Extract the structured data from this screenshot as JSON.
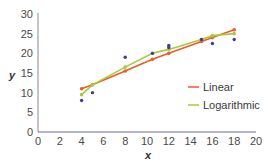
{
  "chart_data": {
    "type": "scatter",
    "title": "",
    "xlabel": "x",
    "ylabel": "y",
    "xlim": [
      0,
      20
    ],
    "ylim": [
      0,
      30
    ],
    "x_ticks": [
      "0",
      "2",
      "4",
      "6",
      "8",
      "10",
      "12",
      "14",
      "16",
      "18",
      "20"
    ],
    "y_ticks": [
      "0",
      "5",
      "10",
      "15",
      "20",
      "25",
      "30"
    ],
    "grid": false,
    "legend_position": "lower-right",
    "scatter": {
      "name": "data",
      "color": "#3b3f96",
      "points": [
        [
          4,
          8
        ],
        [
          5,
          10
        ],
        [
          8,
          19
        ],
        [
          10.5,
          20
        ],
        [
          12,
          22
        ],
        [
          12,
          21.5
        ],
        [
          15,
          23.5
        ],
        [
          16,
          22.5
        ],
        [
          18,
          23.5
        ]
      ]
    },
    "series": [
      {
        "name": "Linear",
        "color": "#ee5a2a",
        "x": [
          4,
          5,
          8,
          10.5,
          12,
          15,
          16,
          18
        ],
        "values": [
          11,
          12,
          15.5,
          18.5,
          20,
          23,
          24,
          26
        ]
      },
      {
        "name": "Logarithmic",
        "color": "#a8c93a",
        "x": [
          4,
          5,
          8,
          10.5,
          12,
          15,
          16,
          18
        ],
        "values": [
          9.5,
          12,
          16.5,
          20,
          21,
          23.5,
          24.5,
          25
        ]
      }
    ]
  },
  "legend": {
    "items": [
      {
        "label": "Linear",
        "color": "#ee5a2a"
      },
      {
        "label": "Logarithmic",
        "color": "#a8c93a"
      }
    ]
  },
  "axes": {
    "x_label": "x",
    "y_label": "y",
    "axis_color": "#6b6b9a"
  }
}
